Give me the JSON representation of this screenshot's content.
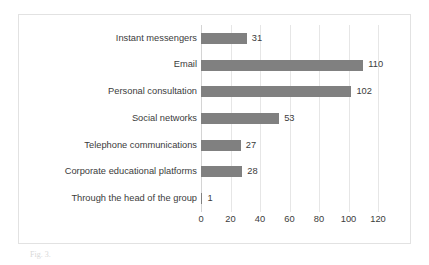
{
  "caption": "Fig. 3.",
  "colors": {
    "bar": "#808080",
    "gridline": "#e6e6e6",
    "axis": "#d4d4d4",
    "text": "#3b3b3b",
    "frame_border": "#e2e2e2"
  },
  "chart_data": {
    "type": "bar",
    "orientation": "horizontal",
    "title": "",
    "subtitle": "",
    "xlabel": "",
    "ylabel": "",
    "categories": [
      "Instant messengers",
      "Email",
      "Personal consultation",
      "Social networks",
      "Telephone communications",
      "Corporate educational platforms",
      "Through the head of the group"
    ],
    "values": [
      31,
      110,
      102,
      53,
      27,
      28,
      1
    ],
    "data_labels": [
      "31",
      "110",
      "102",
      "53",
      "27",
      "28",
      "1"
    ],
    "xlim": [
      0,
      120
    ],
    "xticks": [
      0,
      20,
      40,
      60,
      80,
      100,
      120
    ],
    "xtick_labels": [
      "0",
      "20",
      "40",
      "60",
      "80",
      "100",
      "120"
    ],
    "grid": true,
    "grid_axis": "x",
    "legend": false,
    "legend_position": "none"
  }
}
